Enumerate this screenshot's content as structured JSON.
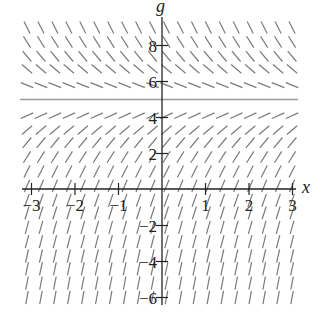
{
  "chart_data": {
    "type": "slope_field",
    "title": "",
    "equation_hint": "dg/dx proportional to (5 - g)",
    "xlabel": "x",
    "ylabel": "g",
    "xlim": [
      -3,
      3
    ],
    "ylim": [
      -6.5,
      9.5
    ],
    "x_ticks": [
      -3,
      -2,
      -1,
      1,
      2,
      3
    ],
    "x_tick_labels": [
      "−3",
      "−2",
      "−1",
      "1",
      "2",
      "3"
    ],
    "y_ticks": [
      8,
      6,
      4,
      2,
      -2,
      -4,
      -6
    ],
    "y_tick_labels": [
      "8",
      "6",
      "4",
      "2",
      "−2",
      "−4",
      "−6"
    ],
    "equilibrium_line": {
      "g": 5,
      "color": "#9a9a9a"
    },
    "grid": false,
    "segment_columns": 20,
    "segment_rows_g": [
      9.0,
      8.2,
      7.4,
      6.7,
      5.8,
      4.1,
      3.3,
      2.6,
      1.8,
      1.0,
      0.2,
      -0.6,
      -1.3,
      -2.1,
      -2.9,
      -3.7,
      -4.4,
      -5.2,
      -6.0
    ],
    "slope_scale": 1.0,
    "segment_color": "#7a7a7a",
    "axis_color": "#222222"
  }
}
